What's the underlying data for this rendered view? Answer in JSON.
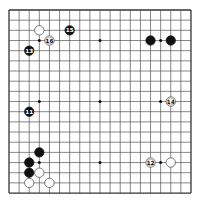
{
  "board": {
    "size": 19,
    "origin_x": 9,
    "origin_y": 10,
    "spacing_x": 10.11,
    "spacing_y": 10.17,
    "line_color": "#555555",
    "border_color": "#333333",
    "background": "#ffffff",
    "star_points": [
      [
        3,
        3
      ],
      [
        9,
        3
      ],
      [
        15,
        3
      ],
      [
        3,
        9
      ],
      [
        9,
        9
      ],
      [
        15,
        9
      ],
      [
        3,
        15
      ],
      [
        9,
        15
      ],
      [
        15,
        15
      ]
    ]
  },
  "colors": {
    "black_stone": "#111111",
    "white_stone": "#ffffff",
    "white_stone_edge": "#444444",
    "black_label": "#ffffff",
    "white_label": "#111111"
  },
  "stones": [
    {
      "color": "white",
      "col": 3,
      "row": 2,
      "label": ""
    },
    {
      "color": "white",
      "col": 4,
      "row": 3,
      "label": "16"
    },
    {
      "color": "black",
      "col": 6,
      "row": 2,
      "label": "15"
    },
    {
      "color": "black",
      "col": 2,
      "row": 4,
      "label": "13"
    },
    {
      "color": "black",
      "col": 14,
      "row": 3,
      "label": ""
    },
    {
      "color": "black",
      "col": 16,
      "row": 3,
      "label": ""
    },
    {
      "color": "white",
      "col": 16,
      "row": 9,
      "label": "14"
    },
    {
      "color": "black",
      "col": 2,
      "row": 10,
      "label": "11"
    },
    {
      "color": "white",
      "col": 14,
      "row": 15,
      "label": "12"
    },
    {
      "color": "white",
      "col": 16,
      "row": 15,
      "label": ""
    },
    {
      "color": "black",
      "col": 3,
      "row": 14,
      "label": ""
    },
    {
      "color": "black",
      "col": 2,
      "row": 15,
      "label": ""
    },
    {
      "color": "black",
      "col": 2,
      "row": 16,
      "label": ""
    },
    {
      "color": "white",
      "col": 3,
      "row": 16,
      "label": ""
    },
    {
      "color": "white",
      "col": 2,
      "row": 17,
      "label": ""
    },
    {
      "color": "white",
      "col": 4,
      "row": 17,
      "label": ""
    }
  ]
}
